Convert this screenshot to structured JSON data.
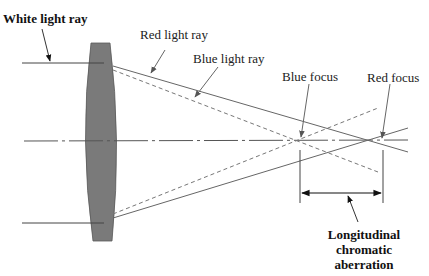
{
  "diagram": {
    "labels": {
      "white_ray": "White light ray",
      "red_ray": "Red light ray",
      "blue_ray": "Blue light ray",
      "blue_focus": "Blue focus",
      "red_focus": "Red focus",
      "aberration_line1": "Longitudinal",
      "aberration_line2": "chromatic",
      "aberration_line3": "aberration"
    },
    "colors": {
      "lens_fill": "#7a7a7a",
      "line": "#555555",
      "text": "#222222"
    },
    "elements": [
      {
        "name": "lens",
        "type": "biconvex lens"
      },
      {
        "name": "optical-axis",
        "style": "dash-dot"
      },
      {
        "name": "red-ray",
        "style": "solid"
      },
      {
        "name": "blue-ray",
        "style": "dashed"
      },
      {
        "name": "focal-shift-dimension",
        "style": "double arrow"
      }
    ]
  }
}
